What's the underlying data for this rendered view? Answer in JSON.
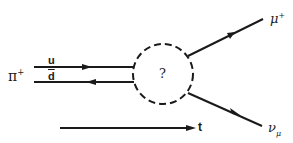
{
  "diagram": {
    "labels": {
      "pion": "π",
      "pion_charge": "+",
      "quark_u": "u",
      "quark_dbar": "d",
      "blob": "?",
      "muon": "μ",
      "muon_charge": "+",
      "neutrino": "ν",
      "neutrino_sub": "μ",
      "time_axis": "t"
    },
    "colors": {
      "line": "#1a1a1a",
      "background": "#ffffff"
    }
  }
}
